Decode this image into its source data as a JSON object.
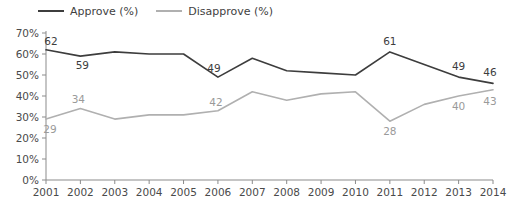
{
  "legend": {
    "position": "top-left",
    "entries": [
      {
        "label": "Approve (%)",
        "color": "#3d3d3d",
        "name": "approve"
      },
      {
        "label": "Disapprove (%)",
        "color": "#b0b0b0",
        "name": "disapprove"
      }
    ]
  },
  "axes": {
    "y_ticks": [
      "0%",
      "10%",
      "20%",
      "30%",
      "40%",
      "50%",
      "60%",
      "70%"
    ],
    "x_ticks": [
      "2001",
      "2002",
      "2003",
      "2004",
      "2005",
      "2006",
      "2007",
      "2008",
      "2009",
      "2010",
      "2011",
      "2012",
      "2013",
      "2014"
    ]
  },
  "chart_data": {
    "type": "line",
    "title": "",
    "subtitle": "",
    "xlabel": "",
    "ylabel": "",
    "xlim": [
      2001,
      2014
    ],
    "ylim": [
      0,
      70
    ],
    "ytick_step": 10,
    "grid": false,
    "legend_position": "top-left",
    "x": [
      2001,
      2002,
      2003,
      2004,
      2005,
      2006,
      2007,
      2008,
      2009,
      2010,
      2011,
      2012,
      2013,
      2014
    ],
    "series": [
      {
        "name": "Approve (%)",
        "color": "#3d3d3d",
        "values": [
          62,
          59,
          61,
          60,
          60,
          49,
          58,
          52,
          51,
          50,
          61,
          55,
          49,
          46
        ],
        "labels": [
          {
            "x": 2001,
            "value": 62,
            "text": "62"
          },
          {
            "x": 2002,
            "value": 59,
            "text": "59"
          },
          {
            "x": 2006,
            "value": 49,
            "text": "49"
          },
          {
            "x": 2011,
            "value": 61,
            "text": "61"
          },
          {
            "x": 2013,
            "value": 49,
            "text": "49"
          },
          {
            "x": 2014,
            "value": 46,
            "text": "46"
          }
        ]
      },
      {
        "name": "Disapprove (%)",
        "color": "#b0b0b0",
        "values": [
          29,
          34,
          29,
          31,
          31,
          33,
          42,
          38,
          41,
          42,
          28,
          36,
          40,
          43
        ],
        "labels": [
          {
            "x": 2002,
            "value": 34,
            "text": "34"
          },
          {
            "x": 2001,
            "value": 29,
            "text": "29"
          },
          {
            "x": 2006,
            "value": 42,
            "text": "42"
          },
          {
            "x": 2011,
            "value": 28,
            "text": "28"
          },
          {
            "x": 2013,
            "value": 40,
            "text": "40"
          },
          {
            "x": 2014,
            "value": 43,
            "text": "43"
          }
        ]
      }
    ]
  }
}
